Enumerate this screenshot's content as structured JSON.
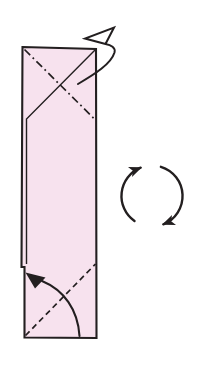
{
  "diagram": {
    "canvas": {
      "width": 197,
      "height": 367,
      "background_color": "#ffffff"
    },
    "colors": {
      "paper_fill": "#f7e2ee",
      "line": "#231f20",
      "edge_shadow": "#8a8a8a"
    },
    "paper": {
      "name": "folded-paper-shape",
      "outline_points": "22.5,47 96,49 96.5,338 24.5,337.5 24.5,267 21.5,267",
      "stroke_width": 2.1
    },
    "fold_lines": [
      {
        "name": "mountain-fold-line",
        "style": "dash-dot",
        "path": "M 24.5,49.5 L 95.5,120",
        "dasharray": "8 3.5 1.8 3.5",
        "width": 1.7
      },
      {
        "name": "flap-edge-line",
        "style": "solid",
        "path": "M 96,49 L 26.5,119 L 26.5,264",
        "dasharray": "",
        "width": 1.4
      },
      {
        "name": "valley-fold-line",
        "style": "dashed",
        "path": "M 25.5,335.5 L 95.5,264",
        "dasharray": "5.8 3.9",
        "width": 1.7
      }
    ],
    "arrows": {
      "turn_over": {
        "name": "turn-over-arrow",
        "head_style": "hollow",
        "path": "M 78,84 C 95,74 111,64 114.5,52.5 C 115.8,47.5 111,45 105.5,44 L 85,38.5 L 114,27.5 L 105.5,44",
        "width": 2
      },
      "valley_fold": {
        "name": "valley-fold-arrow",
        "head_style": "solid",
        "shaft_path": "M 79.5,336 C 78,310 64,290 42,281",
        "head_points": "25.5,272.5 45.5,277.5 35,288.5",
        "width": 2.1
      },
      "rotate": {
        "name": "rotate-clockwise-icon",
        "direction": "clockwise",
        "arc_paths": [
          "M 134.5,221 A 30.5,30.5 0 0 1 140.6,167.7",
          "M 160.9,166.8 A 30.5,30.5 0 0 1 163.4,224.3"
        ],
        "head_path": "M 0,0.5 L 13,6 L 0,11.5 L 3.2,6 Z",
        "width": 2.4
      }
    }
  }
}
